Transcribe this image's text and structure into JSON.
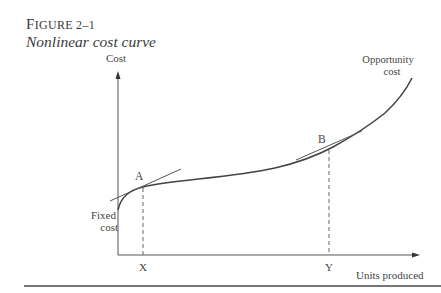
{
  "figure": {
    "label_first": "F",
    "label_rest": "IGURE 2–1",
    "title": "Nonlinear cost curve"
  },
  "axes": {
    "y_label": "Cost",
    "x_label": "Units produced"
  },
  "annotations": {
    "point_a": "A",
    "point_b": "B",
    "fixed_cost_line1": "Fixed",
    "fixed_cost_line2": "cost",
    "opportunity_line1": "Opportunity",
    "opportunity_line2": "cost",
    "x_mark": "X",
    "y_mark": "Y"
  },
  "colors": {
    "ink": "#3a3a3a",
    "curve": "#444444",
    "rule": "#777777"
  }
}
